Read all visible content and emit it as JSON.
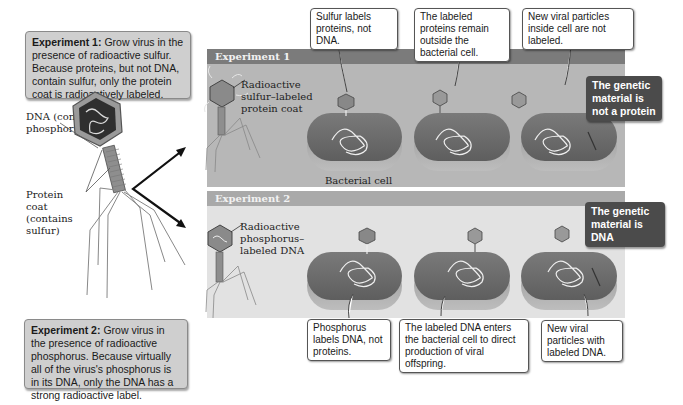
{
  "figure": {
    "type": "Hershey-Chase experiment diagram",
    "color_mode": "grayscale"
  },
  "intro_boxes": {
    "experiment1": {
      "title": "Experiment 1:",
      "text": "Grow virus in the presence of radioactive sulfur. Because proteins, but not DNA, contain sulfur, only the protein coat is radioactively labeled."
    },
    "experiment2": {
      "title": "Experiment 2:",
      "text": "Grow virus in the presence of radioactive phosphorus. Because virtually all of the virus's phosphorus is in its DNA, only the DNA has a strong radioactive label."
    }
  },
  "phage_labels": {
    "dna": "DNA (contains phosphorus)",
    "protein_coat": "Protein coat (contains sulfur)"
  },
  "panels": {
    "experiment1": {
      "header": "Experiment 1",
      "phage_label": "Radioactive sulfur–labeled protein coat",
      "cell_label": "Bacterial cell",
      "callouts": [
        "Sulfur labels proteins, not DNA.",
        "The labeled proteins remain outside the bacterial cell.",
        "New viral particles inside cell are not labeled."
      ],
      "conclusion": "The genetic material is not a protein"
    },
    "experiment2": {
      "header": "Experiment 2",
      "phage_label": "Radioactive phosphorus–labeled DNA",
      "callouts": [
        "Phosphorus labels DNA, not proteins.",
        "The labeled DNA enters the bacterial cell  to direct production of viral offspring.",
        "New viral particles with labeled DNA."
      ],
      "conclusion": "The genetic material is DNA"
    }
  },
  "colors": {
    "exp1_header": "#7b7b7b",
    "exp1_body": "#b7b7b7",
    "exp2_header": "#a9a9a9",
    "exp2_body": "#e2e2e2",
    "conclusion_bg": "#4b4b4b",
    "intro_box_bg": "#cfcfcf"
  }
}
